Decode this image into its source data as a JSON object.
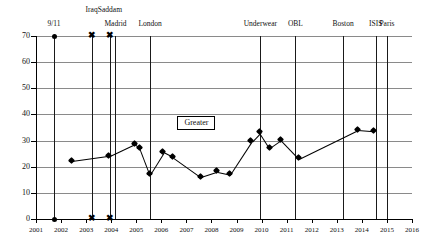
{
  "chart_data": {
    "type": "line",
    "title": "",
    "xlabel": "",
    "ylabel": "",
    "xlim": [
      2001,
      2016
    ],
    "ylim": [
      0,
      70
    ],
    "grid": true,
    "legend": "none",
    "yticks": [
      0,
      10,
      20,
      30,
      40,
      50,
      60,
      70
    ],
    "xticks": [
      2001,
      2002,
      2003,
      2004,
      2005,
      2006,
      2007,
      2008,
      2009,
      2010,
      2011,
      2012,
      2013,
      2014,
      2015,
      2016
    ],
    "series": [
      {
        "name": "Greater",
        "x": [
          2002.45,
          2003.95,
          2004.95,
          2005.15,
          2005.55,
          2006.1,
          2006.5,
          2007.6,
          2008.25,
          2008.75,
          2009.6,
          2009.95,
          2010.35,
          2010.8,
          2011.5,
          2013.85,
          2014.5
        ],
        "values": [
          22,
          24,
          28.5,
          27,
          17,
          25.5,
          23.5,
          16,
          18,
          17,
          29.5,
          33,
          27,
          30,
          23,
          34,
          33.5
        ]
      }
    ],
    "annotations": [
      {
        "label": "Greater",
        "x": 2007.4,
        "y": 37
      }
    ],
    "event_markers": [
      {
        "label": "9/11",
        "x": 2001.72,
        "row": 1,
        "marker": "dot"
      },
      {
        "label": "Iraq",
        "x": 2003.22,
        "row": 0,
        "marker": "x"
      },
      {
        "label": "Saddam",
        "x": 2003.95,
        "row": 0,
        "marker": "x"
      },
      {
        "label": "Madrid",
        "x": 2004.17,
        "row": 1,
        "marker": "none"
      },
      {
        "label": "London",
        "x": 2005.55,
        "row": 1,
        "marker": "none"
      },
      {
        "label": "Underwear",
        "x": 2009.95,
        "row": 1,
        "marker": "none"
      },
      {
        "label": "OBL",
        "x": 2011.35,
        "row": 1,
        "marker": "none"
      },
      {
        "label": "Boston",
        "x": 2013.25,
        "row": 1,
        "marker": "none"
      },
      {
        "label": "ISIS",
        "x": 2014.55,
        "row": 1,
        "marker": "none"
      },
      {
        "label": "Paris",
        "x": 2015.0,
        "row": 1,
        "marker": "none"
      }
    ]
  }
}
